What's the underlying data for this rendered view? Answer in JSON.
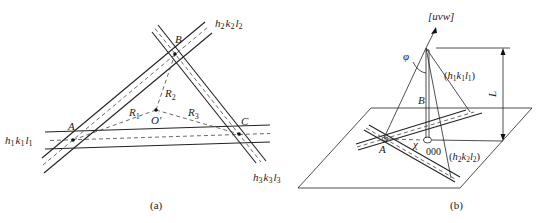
{
  "figure": {
    "panel_a": {
      "caption": "(a)",
      "bands": [
        {
          "id": "band-1",
          "label": "h₁k₁l₁"
        },
        {
          "id": "band-2",
          "label": "h₂k₂l₂"
        },
        {
          "id": "band-3",
          "label": "h₃k₃l₃"
        }
      ],
      "points": {
        "A": "A",
        "B": "B",
        "C": "C",
        "O": "O′"
      },
      "radii": {
        "R1": "R",
        "R1_sub": "1",
        "R2": "R",
        "R2_sub": "2",
        "R3": "R",
        "R3_sub": "3"
      },
      "band_label_parts": {
        "b1": {
          "h": "h",
          "hs": "1",
          "k": "k",
          "ks": "1",
          "l": "l",
          "ls": "1"
        },
        "b2": {
          "h": "h",
          "hs": "2",
          "k": "k",
          "ks": "2",
          "l": "l",
          "ls": "2"
        },
        "b3": {
          "h": "h",
          "hs": "3",
          "k": "k",
          "ks": "3",
          "l": "l",
          "ls": "3"
        }
      }
    },
    "panel_b": {
      "caption": "(b)",
      "zone_axis_label": "[uvw]",
      "angle_phi": "φ",
      "angle_chi": "χ",
      "point_B": "B",
      "point_A": "A",
      "origin_label": "000",
      "length_label": "L",
      "plane1_label": {
        "open": "(",
        "h": "h",
        "hs": "1",
        "k": "k",
        "ks": "1",
        "l": "l",
        "ls": "1",
        "close": ")"
      },
      "plane2_label": {
        "open": "(",
        "h": "h",
        "hs": "2",
        "k": "k",
        "ks": "2",
        "l": "l",
        "ls": "2",
        "close": ")"
      }
    }
  }
}
